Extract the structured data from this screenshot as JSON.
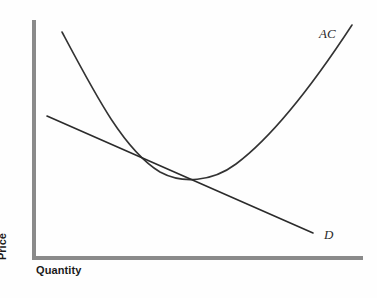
{
  "figure": {
    "width": 377,
    "height": 298,
    "background": "#fefefe"
  },
  "axes": {
    "color": "#8a8a8a",
    "thickness": 4,
    "x_label": "Quantity",
    "y_label": "Price",
    "origin": {
      "x": 34,
      "y": 258
    },
    "x_end": 363,
    "y_top": 20
  },
  "labels": {
    "ac": "AC",
    "d": "D"
  },
  "chart_data": {
    "type": "line",
    "title": "",
    "xlabel": "Quantity",
    "ylabel": "Price",
    "xlim": [
      0,
      1
    ],
    "ylim": [
      0,
      1
    ],
    "grid": false,
    "legend": "inline-curve-labels",
    "annotations": [
      {
        "text": "AC",
        "x": 320,
        "y": 35,
        "style": "italic-serif"
      },
      {
        "text": "D",
        "x": 325,
        "y": 236,
        "style": "italic-serif"
      }
    ],
    "series": [
      {
        "name": "AC",
        "label": "AC",
        "kind": "average-cost-curve",
        "shape": "u-shaped",
        "color": "#333333",
        "path": "M 62 32 C 96 96, 124 150, 160 172 C 182 184, 212 182, 236 164 C 276 134, 316 80, 352 25",
        "points": [
          {
            "x": 62,
            "y": 32
          },
          {
            "x": 90,
            "y": 86
          },
          {
            "x": 115,
            "y": 128
          },
          {
            "x": 140,
            "y": 157
          },
          {
            "x": 160,
            "y": 170
          },
          {
            "x": 180,
            "y": 176
          },
          {
            "x": 205,
            "y": 177
          },
          {
            "x": 230,
            "y": 168
          },
          {
            "x": 255,
            "y": 152
          },
          {
            "x": 280,
            "y": 126
          },
          {
            "x": 305,
            "y": 95
          },
          {
            "x": 330,
            "y": 60
          },
          {
            "x": 352,
            "y": 25
          }
        ],
        "minimum_point": {
          "x": 205,
          "y": 177
        }
      },
      {
        "name": "D",
        "label": "D",
        "kind": "demand-curve",
        "shape": "downward-sloping-line",
        "color": "#2b2b2b",
        "path": "M 47 116 L 313 233",
        "points": [
          {
            "x": 47,
            "y": 116
          },
          {
            "x": 313,
            "y": 233
          }
        ]
      }
    ],
    "tangency_point": {
      "x": 154,
      "y": 171,
      "description": "AC tangent to D"
    }
  }
}
